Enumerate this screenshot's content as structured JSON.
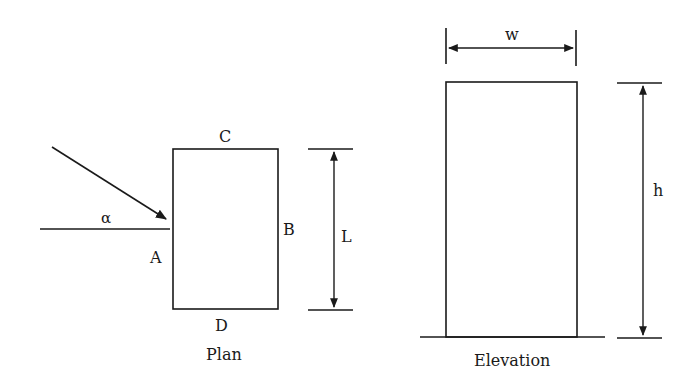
{
  "plan": {
    "title": "Plan",
    "sides": {
      "a": "A",
      "b": "B",
      "c": "C",
      "d": "D"
    },
    "angle_label": "α",
    "dimension_label": "L"
  },
  "elevation": {
    "title": "Elevation",
    "width_label": "w",
    "height_label": "h"
  },
  "colors": {
    "line": "#1a1a1a",
    "background": "#ffffff"
  }
}
